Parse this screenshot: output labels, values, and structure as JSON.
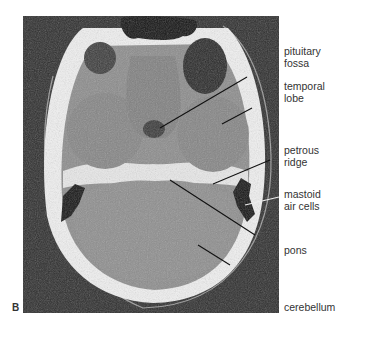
{
  "figure": {
    "panel_letter": "B",
    "labels": [
      {
        "id": "pituitary-fossa",
        "text": "pituitary\nfossa",
        "top": 46
      },
      {
        "id": "temporal-lobe",
        "text": "temporal\nlobe",
        "top": 81
      },
      {
        "id": "petrous-ridge",
        "text": "petrous\nridge",
        "top": 145
      },
      {
        "id": "mastoid-air-cells",
        "text": "mastoid\nair cells",
        "top": 189
      },
      {
        "id": "pons",
        "text": "pons",
        "top": 245
      },
      {
        "id": "cerebellum",
        "text": "cerebellum",
        "top": 302
      }
    ],
    "colors": {
      "background": "#ffffff",
      "scan_background": "#2b2b2b",
      "bone": "#f2f2f2",
      "brain": "#8a8a8a",
      "air": "#151515",
      "label_text": "#333333"
    }
  }
}
